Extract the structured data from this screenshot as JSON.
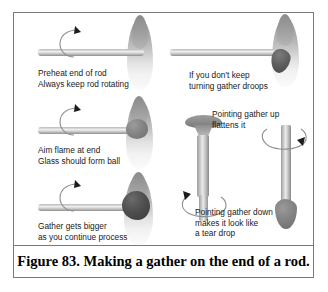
{
  "figure": {
    "caption": "Figure 83.  Making a gather on the end of a rod.",
    "border_color": "#7a7a7a",
    "background": "#ffffff",
    "text_color": "#1a1a1a",
    "rod_color": "#c9c9c9",
    "flame_color": "#a8a8a8",
    "gather_color": "#6e6e6e"
  },
  "panels": [
    {
      "id": "panel-preheat",
      "name": "preheat-end-of-rod",
      "caption_lines": [
        "Preheat end of rod",
        "Always keep rod rotating"
      ],
      "has_rotation_arrow": true,
      "rod_orientation": "horizontal",
      "gather": "none"
    },
    {
      "id": "panel-aim-flame",
      "name": "aim-flame-at-end",
      "caption_lines": [
        "Aim flame at end",
        "Glass should form ball"
      ],
      "has_rotation_arrow": true,
      "rod_orientation": "horizontal",
      "gather": "small-ball"
    },
    {
      "id": "panel-gather-bigger",
      "name": "gather-gets-bigger",
      "caption_lines": [
        "Gather gets bigger",
        "as you continue process"
      ],
      "has_rotation_arrow": true,
      "rod_orientation": "horizontal",
      "gather": "large-ball"
    },
    {
      "id": "panel-droop",
      "name": "gather-droops",
      "caption_lines": [
        "If you don't keep",
        "turning gather droops"
      ],
      "has_rotation_arrow": false,
      "rod_orientation": "horizontal",
      "gather": "drooping"
    },
    {
      "id": "panel-point-up",
      "name": "pointing-gather-up",
      "caption_lines": [
        "Pointing gather up",
        "flattens it"
      ],
      "has_rotation_arrow": true,
      "rod_orientation": "vertical",
      "gather": "flattened-disc"
    },
    {
      "id": "panel-point-down",
      "name": "pointing-gather-down",
      "caption_lines": [
        "Pointing gather down",
        "makes it look like",
        "a tear drop"
      ],
      "has_rotation_arrow": true,
      "rod_orientation": "vertical",
      "gather": "tear-drop"
    }
  ]
}
